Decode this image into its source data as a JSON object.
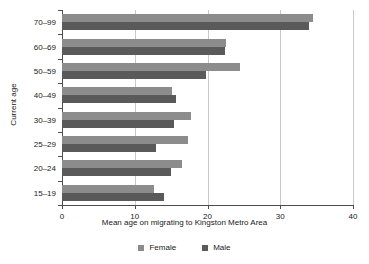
{
  "chart_data": {
    "type": "bar",
    "orientation": "horizontal",
    "title": "",
    "xlabel": "Mean age on migrating to Kingston Metro Area",
    "ylabel": "Current age",
    "categories": [
      "70–99",
      "60–69",
      "50–59",
      "40–49",
      "30–39",
      "25–29",
      "20–24",
      "15–19"
    ],
    "series": [
      {
        "name": "Female",
        "color": "#8c8c8c",
        "values": [
          34.5,
          22.5,
          24.5,
          15.1,
          17.7,
          17.3,
          16.5,
          12.7
        ]
      },
      {
        "name": "Male",
        "color": "#5a5a5a",
        "values": [
          34.0,
          22.4,
          19.8,
          15.7,
          15.4,
          12.9,
          15.0,
          14.0
        ]
      }
    ],
    "xlim": [
      0,
      40
    ],
    "xticks": [
      0,
      10,
      20,
      30,
      40
    ],
    "xticklabels": [
      "0",
      "10",
      "20",
      "30",
      "40"
    ],
    "grid": "vertical",
    "gridlines_at": [
      10,
      20,
      30,
      40
    ],
    "legend": {
      "position": "bottom",
      "entries": [
        {
          "label": "Female",
          "color": "#8c8c8c",
          "swatch": "square-swatch-icon"
        },
        {
          "label": "Male",
          "color": "#5a5a5a",
          "swatch": "square-swatch-icon"
        }
      ]
    }
  }
}
